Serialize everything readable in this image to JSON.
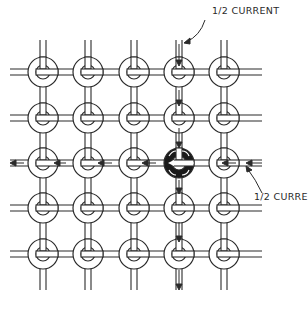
{
  "diagram": {
    "grid": {
      "columns": [
        43,
        88,
        134,
        179,
        224
      ],
      "rows": [
        72,
        118,
        163,
        208,
        254
      ],
      "core_outer_radius": 15,
      "core_inner_radius": 7,
      "rows_count": 5,
      "columns_count": 5
    },
    "selected_core": {
      "row": 2,
      "column": 3
    },
    "energized_wires": {
      "vertical_column": 3,
      "horizontal_row": 2
    },
    "labels": [
      {
        "id": "top-current-label",
        "text": "1/2 CURRENT",
        "x": 212,
        "y": 14
      },
      {
        "id": "right-current-label",
        "text": "1/2 CURRENT",
        "x": 254,
        "y": 200
      }
    ],
    "colors": {
      "line": "#2a2a2a",
      "core_fill": "#ffffff",
      "selected_core_fill": "#1a1a1a",
      "background": "#ffffff"
    }
  }
}
